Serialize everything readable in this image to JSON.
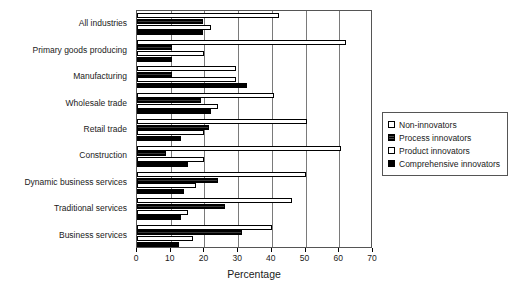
{
  "chart_data": {
    "type": "bar",
    "orientation": "horizontal",
    "title": "",
    "xlabel": "Percentage",
    "ylabel": "",
    "xlim": [
      0,
      70
    ],
    "xticks": [
      0,
      10,
      20,
      30,
      40,
      50,
      60,
      70
    ],
    "grid": true,
    "legend_position": "right",
    "categories": [
      "All industries",
      "Primary goods producing",
      "Manufacturing",
      "Wholesale trade",
      "Retail trade",
      "Construction",
      "Dynamic business services",
      "Traditional services",
      "Business services"
    ],
    "series": [
      {
        "name": "Non-innovators",
        "fill": "white",
        "values": [
          42,
          62,
          29.5,
          40.5,
          50.5,
          60.5,
          50,
          46,
          40
        ]
      },
      {
        "name": "Process innovators",
        "fill": "dark",
        "values": [
          19.5,
          10.5,
          10.5,
          19,
          21.5,
          8.5,
          24,
          26,
          31
        ]
      },
      {
        "name": "Product innovators",
        "fill": "white",
        "values": [
          22,
          20,
          29.5,
          24,
          20,
          20,
          17.5,
          15,
          16.5
        ]
      },
      {
        "name": "Comprehensive innovators",
        "fill": "black",
        "values": [
          19.5,
          10.5,
          32.5,
          22,
          13,
          15,
          14,
          13,
          12.5
        ]
      }
    ]
  },
  "legend": {
    "items": [
      {
        "label": "Non-innovators",
        "fill": "white"
      },
      {
        "label": "Process innovators",
        "fill": "dark"
      },
      {
        "label": "Product innovators",
        "fill": "white"
      },
      {
        "label": "Comprehensive innovators",
        "fill": "black"
      }
    ]
  },
  "colors": {
    "axis": "#555555",
    "grid": "#7a7a7a",
    "bar_outline": "#000000",
    "bar_white": "#ffffff",
    "bar_black": "#000000",
    "background": "#ffffff"
  }
}
